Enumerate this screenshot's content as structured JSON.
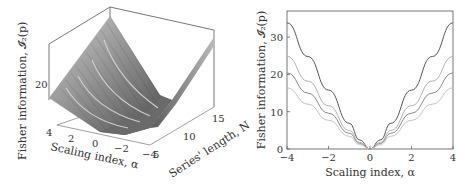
{
  "chart_data": [
    {
      "type": "surface",
      "title": "",
      "xlabel": "Scaling index, α",
      "ylabel": "Series' length, N",
      "zlabel": "Fisher information, 𝓘₂(p)",
      "x_ticks": [
        "4",
        "2",
        "0",
        "−2",
        "−4"
      ],
      "y_ticks": [
        "5",
        "10",
        "15"
      ],
      "z_ticks": [
        "20"
      ],
      "xlim": [
        -4,
        4
      ],
      "ylim": [
        5,
        16
      ],
      "colormap": "grayscale",
      "description": "V-shaped surface in α, minimum ~0 at α=0; height grows with N"
    },
    {
      "type": "line",
      "title": "",
      "xlabel": "Scaling index, α",
      "ylabel": "Fisher information, 𝓘₂(p)",
      "x_ticks": [
        "−4",
        "−2",
        "0",
        "2",
        "4"
      ],
      "y_ticks": [
        "0",
        "10",
        "20",
        "30"
      ],
      "xlim": [
        -4,
        4
      ],
      "ylim": [
        0,
        37
      ],
      "grid": false,
      "x": [
        -4,
        -3,
        -2,
        -1,
        -0.5,
        0,
        0.5,
        1,
        2,
        3,
        4
      ],
      "series": [
        {
          "name": "curve 1",
          "color": "#555555",
          "values": [
            33.8,
            24.8,
            15.8,
            6.9,
            2.4,
            0,
            2.4,
            6.9,
            15.8,
            24.8,
            33.8
          ]
        },
        {
          "name": "curve 2",
          "color": "#b0b0b0",
          "values": [
            24.8,
            18.2,
            11.6,
            5.0,
            1.8,
            0,
            1.8,
            5.0,
            11.6,
            18.2,
            24.8
          ]
        },
        {
          "name": "curve 3",
          "color": "#8a8a8a",
          "values": [
            20.4,
            15.0,
            9.6,
            4.2,
            1.5,
            0,
            1.5,
            4.2,
            9.6,
            15.0,
            20.4
          ]
        },
        {
          "name": "curve 4",
          "color": "#c4c4c4",
          "values": [
            16.4,
            12.0,
            7.7,
            3.4,
            1.2,
            0,
            1.2,
            3.4,
            7.7,
            12.0,
            16.4
          ]
        }
      ]
    }
  ]
}
